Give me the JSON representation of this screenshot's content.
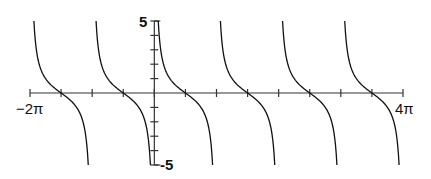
{
  "chart_data": {
    "type": "line",
    "title": "",
    "function": "y = cot(x)",
    "xlabel": "",
    "ylabel": "",
    "xlim_labels": [
      "−2π",
      "4π"
    ],
    "ylim": [
      -5,
      5
    ],
    "xlim": [
      -6.2832,
      12.5664
    ],
    "x_tick_step": "π/2",
    "y_tick_step": 1,
    "y_tick_labels": [
      "5",
      "-5"
    ],
    "zeros": [
      "−3π/2",
      "−π/2",
      "π/2",
      "3π/2",
      "5π/2",
      "7π/2"
    ],
    "asymptotes": [
      "−2π",
      "−π",
      "0",
      "π",
      "2π",
      "3π",
      "4π"
    ],
    "grid": false,
    "color": "#111111"
  },
  "labels": {
    "x_min": "−2π",
    "x_max": "4π",
    "y_max": "5",
    "y_min": "-5"
  }
}
